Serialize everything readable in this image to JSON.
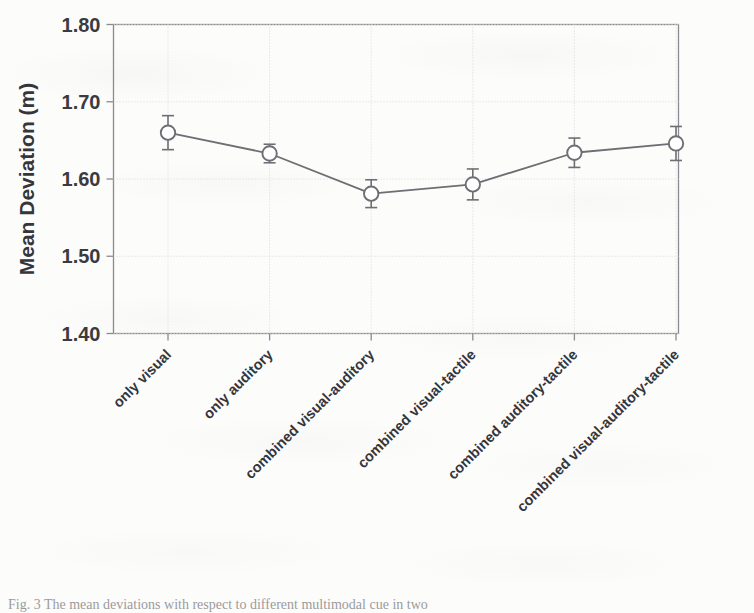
{
  "figure": {
    "background_color": "#fcfcfb",
    "line_color": "#6e6e74",
    "marker_fill": "#ffffff",
    "marker_stroke": "#6e6e74",
    "axis_color": "#8a8a90",
    "grid_color": "#d8d8dc",
    "text_color": "#35353a",
    "caption": "Fig. 3  The mean deviations with respect to different multimodal cue in two"
  },
  "chart_data": {
    "type": "line",
    "title": "",
    "xlabel": "",
    "ylabel": "Mean Deviation (m)",
    "ylim": [
      1.4,
      1.8
    ],
    "yticks": [
      1.4,
      1.5,
      1.6,
      1.7,
      1.8
    ],
    "ytick_labels": [
      "1.40",
      "1.50",
      "1.60",
      "1.70",
      "1.80"
    ],
    "grid": true,
    "grid_axis": "y",
    "legend": "none",
    "marker": "open-circle",
    "error_bars": "symmetric",
    "categories": [
      "only visual",
      "only auditory",
      "combined visual-auditory",
      "combined visual-tactile",
      "combined auditory-tactile",
      "combined visual-auditory-tactile"
    ],
    "values": [
      1.66,
      1.633,
      1.581,
      1.593,
      1.634,
      1.646
    ],
    "errors": [
      0.022,
      0.012,
      0.018,
      0.02,
      0.019,
      0.022
    ],
    "series": [
      {
        "name": "Mean Deviation",
        "values": [
          1.66,
          1.633,
          1.581,
          1.593,
          1.634,
          1.646
        ],
        "errors": [
          0.022,
          0.012,
          0.018,
          0.02,
          0.019,
          0.022
        ]
      }
    ]
  }
}
